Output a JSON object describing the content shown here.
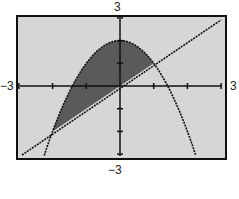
{
  "labels": {
    "ymax": "3",
    "ymin": "−3",
    "xmin": "−3",
    "xmax": "3"
  },
  "colors": {
    "background": "#d6d6d6",
    "shade": "#5a5a5a",
    "curve": "#111111",
    "frame": "#111111"
  },
  "chart_data": {
    "type": "line",
    "title": "",
    "xlabel": "",
    "ylabel": "",
    "xlim": [
      -3,
      3
    ],
    "ylim": [
      -3,
      3
    ],
    "x_ticks": [
      -3,
      -2,
      -1,
      0,
      1,
      2,
      3
    ],
    "y_ticks": [
      -3,
      -2,
      -1,
      0,
      1,
      2,
      3
    ],
    "grid": false,
    "series": [
      {
        "name": "y = 2 - x^2",
        "kind": "parabola",
        "x": [
          -2.3,
          -2,
          -1.5,
          -1,
          -0.5,
          0,
          0.5,
          1,
          1.5,
          2,
          2.3
        ],
        "values": [
          -3.29,
          -2,
          -0.25,
          1,
          1.75,
          2,
          1.75,
          1,
          -0.25,
          -2,
          -3.29
        ]
      },
      {
        "name": "y = x",
        "kind": "line",
        "x": [
          -3,
          3
        ],
        "values": [
          -3,
          3
        ]
      }
    ],
    "shaded_region": {
      "between": [
        "y = 2 - x^2",
        "y = x"
      ],
      "x_range": [
        -2,
        1
      ]
    },
    "intersections": [
      [
        -2,
        -2
      ],
      [
        1,
        1
      ]
    ]
  }
}
